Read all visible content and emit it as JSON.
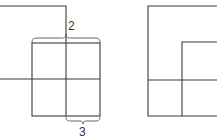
{
  "figure": {
    "left_panel": {
      "brace_top_label": "2",
      "brace_bottom_label": "3"
    },
    "right_panel": {},
    "colors": {
      "line": "#3a3a3a",
      "background": "#ffffff"
    }
  }
}
